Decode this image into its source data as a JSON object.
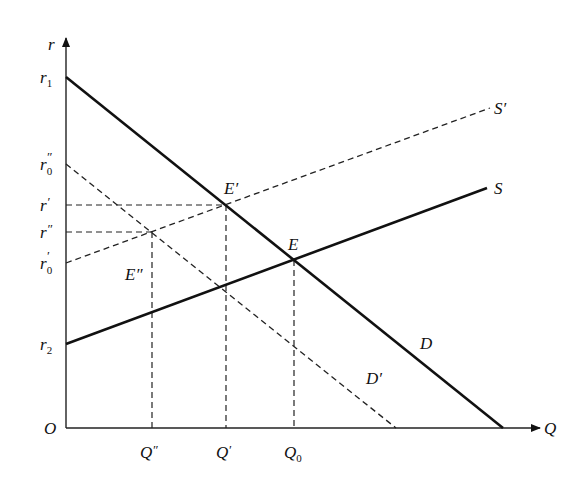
{
  "diagram": {
    "type": "supply-demand",
    "axes": {
      "origin_label": "O",
      "x_label": "Q",
      "y_label": "r"
    },
    "y_ticks": [
      {
        "id": "r1",
        "base": "r",
        "sub": "1",
        "sup": "",
        "y": 77
      },
      {
        "id": "r0pp",
        "base": "r",
        "sub": "0",
        "sup": "″",
        "y": 164
      },
      {
        "id": "rp",
        "base": "r",
        "sub": "",
        "sup": "′",
        "y": 205
      },
      {
        "id": "rpp",
        "base": "r",
        "sub": "",
        "sup": "″",
        "y": 232
      },
      {
        "id": "r0p",
        "base": "r",
        "sub": "0",
        "sup": "′",
        "y": 263
      },
      {
        "id": "r2",
        "base": "r",
        "sub": "2",
        "sup": "",
        "y": 344
      }
    ],
    "x_ticks": [
      {
        "id": "Qpp",
        "base": "Q",
        "sub": "",
        "sup": "″",
        "x": 152
      },
      {
        "id": "Qp",
        "base": "Q",
        "sub": "",
        "sup": "′",
        "x": 226
      },
      {
        "id": "Q0",
        "base": "Q",
        "sub": "0",
        "sup": "",
        "x": 294
      }
    ],
    "curves": [
      {
        "id": "D",
        "label": "D",
        "style": "solid"
      },
      {
        "id": "Dp",
        "label": "D′",
        "style": "dashed"
      },
      {
        "id": "S",
        "label": "S",
        "style": "solid"
      },
      {
        "id": "Sp",
        "label": "S′",
        "style": "dashed"
      }
    ],
    "points": [
      {
        "id": "E",
        "label": "E"
      },
      {
        "id": "Ep",
        "label": "E′"
      },
      {
        "id": "Epp",
        "label": "E″"
      }
    ]
  },
  "labels": {
    "origin": "O",
    "x_axis": "Q",
    "y_axis": "r",
    "r1": "r",
    "r1_sub": "1",
    "r0pp": "r",
    "r0pp_sub": "0",
    "r0pp_sup": "″",
    "rp": "r",
    "rp_sup": "′",
    "rpp": "r",
    "rpp_sup": "″",
    "r0p": "r",
    "r0p_sub": "0",
    "r0p_sup": "′",
    "r2": "r",
    "r2_sub": "2",
    "Qpp": "Q",
    "Qpp_sup": "″",
    "Qp": "Q",
    "Qp_sup": "′",
    "Q0": "Q",
    "Q0_sub": "0",
    "D": "D",
    "Dp": "D′",
    "S": "S",
    "Sp": "S′",
    "E": "E",
    "Ep": "E′",
    "Epp": "E″"
  }
}
